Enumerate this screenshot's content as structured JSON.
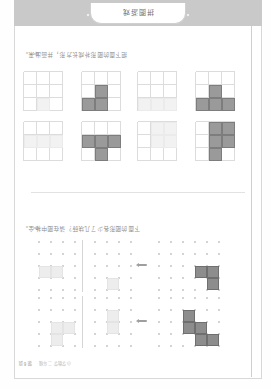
{
  "page": {
    "header_text": "小学数学 二年级",
    "header_page_number": "第6页",
    "banner_label": "拼图游戏"
  },
  "exercises": [
    {
      "id": "exercise-top",
      "instruction": "下面的图形各少了几块砖？请在图中补全。",
      "rows": [
        {
          "id": "row-1",
          "prompt_shape": {
            "name": "S-tetromino-prompt",
            "cells": [
              [
                0,
                0
              ],
              [
                0,
                1
              ],
              [
                1,
                1
              ],
              [
                1,
                2
              ],
              [
                2,
                2
              ]
            ],
            "fill": "dark"
          },
          "options": [
            {
              "name": "option-1a",
              "cells": [
                [
                  1,
                  1
                ],
                [
                  2,
                  1
                ]
              ],
              "fill": "faint"
            },
            {
              "name": "option-1b",
              "cells": [
                [
                  0,
                  1
                ],
                [
                  1,
                  0
                ],
                [
                  1,
                  1
                ]
              ],
              "fill": "faint"
            }
          ]
        },
        {
          "id": "row-2",
          "prompt_shape": {
            "name": "L-tromino-prompt",
            "cells": [
              [
                0,
                0
              ],
              [
                1,
                0
              ],
              [
                1,
                1
              ]
            ],
            "fill": "dark"
          },
          "options": [
            {
              "name": "option-2a",
              "cells": [
                [
                  0,
                  1
                ]
              ],
              "fill": "faint"
            },
            {
              "name": "option-2b",
              "cells": [
                [
                  1,
                  1
                ],
                [
                  1,
                  2
                ]
              ],
              "fill": "faint"
            }
          ]
        }
      ]
    },
    {
      "id": "exercise-bottom",
      "instruction": "把下面的图形补成长方形，并画出来。",
      "pairs": [
        {
          "id": "pair-1",
          "shape": {
            "name": "S-shape-1",
            "cells": [
              [
                0,
                1
              ],
              [
                1,
                0
              ],
              [
                1,
                1
              ],
              [
                2,
                0
              ],
              [
                2,
                1
              ]
            ],
            "fill": "mid"
          },
          "answer": {
            "name": "answer-1",
            "cells": [
              [
                1,
                0
              ],
              [
                1,
                1
              ],
              [
                2,
                0
              ],
              [
                2,
                1
              ]
            ],
            "fill": "ghost"
          }
        },
        {
          "id": "pair-2",
          "shape": {
            "name": "T-shape-2",
            "cells": [
              [
                0,
                1
              ],
              [
                1,
                0
              ],
              [
                1,
                1
              ],
              [
                1,
                2
              ]
            ],
            "fill": "mid"
          },
          "answer": {
            "name": "answer-2",
            "cells": [
              [
                1,
                0
              ],
              [
                1,
                1
              ],
              [
                1,
                2
              ]
            ],
            "fill": "ghost"
          }
        },
        {
          "id": "pair-3",
          "shape": {
            "name": "T-shape-3",
            "cells": [
              [
                0,
                0
              ],
              [
                0,
                1
              ],
              [
                0,
                2
              ],
              [
                1,
                1
              ]
            ],
            "fill": "mid"
          },
          "answer": {
            "name": "answer-3",
            "cells": [
              [
                0,
                0
              ],
              [
                0,
                1
              ],
              [
                0,
                2
              ]
            ],
            "fill": "ghost"
          }
        },
        {
          "id": "pair-4",
          "shape": {
            "name": "S-shape-4",
            "cells": [
              [
                0,
                1
              ],
              [
                0,
                2
              ],
              [
                1,
                1
              ]
            ],
            "fill": "mid"
          },
          "answer": {
            "name": "answer-4",
            "cells": [
              [
                0,
                1
              ]
            ],
            "fill": "ghost"
          }
        }
      ]
    }
  ],
  "colors": {
    "shape_dark": "#8d8d8d",
    "shape_mid": "#9a9a9a",
    "shape_faint": "#ededed",
    "grid_dot": "#cdcdcd",
    "banner": "#c9c9c9"
  }
}
